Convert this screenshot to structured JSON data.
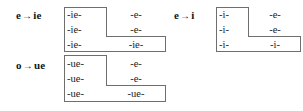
{
  "figure": {
    "background_color": "#ffffff",
    "box_stroke_color": "#6e6e6e",
    "text_color": "#1c1c1c"
  },
  "groups": [
    {
      "id": "e-to-ie",
      "label": {
        "from": "e",
        "arrow": "→",
        "to": "ie"
      },
      "rows": [
        {
          "left": "-ie-",
          "right": "-e-"
        },
        {
          "left": "-ie-",
          "right": "-e-"
        },
        {
          "left": "-ie-",
          "right": "-ie-"
        }
      ]
    },
    {
      "id": "o-to-ue",
      "label": {
        "from": "o",
        "arrow": "→",
        "to": "ue"
      },
      "rows": [
        {
          "left": "-ue-",
          "right": "-e-"
        },
        {
          "left": "-ue-",
          "right": "-e-"
        },
        {
          "left": "-ue-",
          "right": "-ue-"
        }
      ]
    },
    {
      "id": "e-to-i",
      "label": {
        "from": "e",
        "arrow": "→",
        "to": "i"
      },
      "rows": [
        {
          "left": "-i-",
          "right": "-e-"
        },
        {
          "left": "-i-",
          "right": "-e-"
        },
        {
          "left": "-i-",
          "right": "-i-"
        }
      ]
    }
  ]
}
